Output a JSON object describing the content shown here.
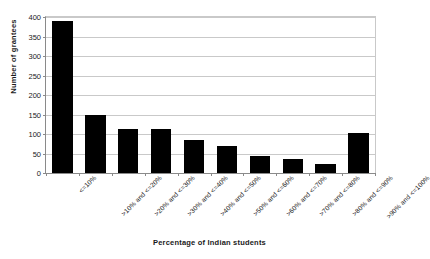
{
  "chart_data": {
    "type": "bar",
    "title": "",
    "subtitle": "",
    "xlabel": "Percentage of Indian students",
    "ylabel": "Number of grantees",
    "categories": [
      "<=10%",
      ">10% and <=20%",
      ">20% and <=30%",
      ">30% and <=40%",
      ">40% and <=50%",
      ">50% and <=60%",
      ">60% and <=70%",
      ">70% and <=80%",
      ">80% and <=90%",
      ">90% and <=100%"
    ],
    "values": [
      390,
      148,
      112,
      113,
      85,
      68,
      43,
      35,
      22,
      103
    ],
    "ylim": [
      0,
      400
    ],
    "yticks": [
      0,
      50,
      100,
      150,
      200,
      250,
      300,
      350,
      400
    ],
    "ytick_labels": [
      "0",
      "50",
      "100",
      "150",
      "200",
      "250",
      "300",
      "350",
      "400"
    ],
    "grid": true,
    "grid_axis": "y",
    "legend": false,
    "legend_position": "none",
    "bar_color": "#000000",
    "background_color": "#ffffff",
    "axis_color": "#8a8a8a",
    "grid_color": "#c9c9c9",
    "label_rotation": -45
  }
}
